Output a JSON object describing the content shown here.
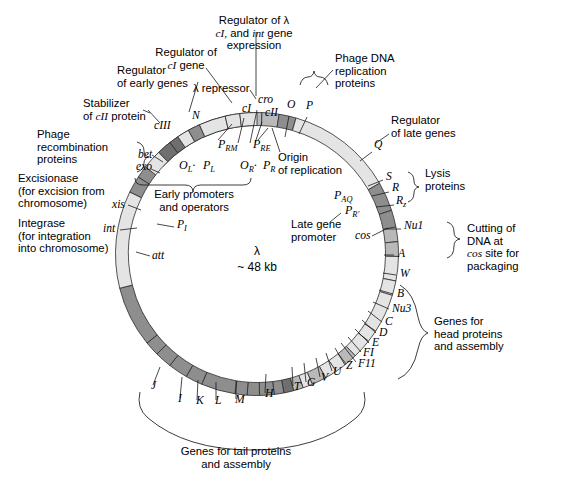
{
  "figure": {
    "center_label_line1": "λ",
    "center_label_line2": "~ 48 kb"
  },
  "colors": {
    "light": "#e4e4e4",
    "medium": "#b9b9b9",
    "dark": "#8e8e8e",
    "darkest": "#6f6f6f",
    "outline": "#2b2b2b",
    "text": "#000000",
    "background": "#ffffff"
  },
  "chart_data": {
    "type": "diagram",
    "subtype": "circular-genome-map",
    "title": "λ ~ 48 kb",
    "radius_px": 135,
    "band_width_px": 13,
    "center": [
      257,
      254
    ],
    "note": "Angles are degrees clockwise from 12 o'clock (top).",
    "segments": [
      {
        "name": "N",
        "start": -47,
        "end": -33,
        "shade": "light"
      },
      {
        "name": "spacer1",
        "start": -33,
        "end": -26,
        "shade": "light"
      },
      {
        "name": "cI",
        "start": -25,
        "end": -12,
        "shade": "darkest"
      },
      {
        "name": "gap_cI_cII",
        "start": -12,
        "end": -9,
        "shade": "light"
      },
      {
        "name": "cII",
        "start": -9,
        "end": -4,
        "shade": "darkest"
      },
      {
        "name": "ori",
        "start": -4,
        "end": 2,
        "shade": "medium"
      },
      {
        "name": "O",
        "start": 2,
        "end": 9,
        "shade": "medium"
      },
      {
        "name": "P",
        "start": 9,
        "end": 16,
        "shade": "dark"
      },
      {
        "name": "post_P",
        "start": 16,
        "end": 60,
        "shade": "light"
      },
      {
        "name": "Q",
        "start": 60,
        "end": 72,
        "shade": "dark"
      },
      {
        "name": "S",
        "start": 72,
        "end": 79,
        "shade": "dark"
      },
      {
        "name": "R",
        "start": 79,
        "end": 85,
        "shade": "medium"
      },
      {
        "name": "Rz",
        "start": 85,
        "end": 91,
        "shade": "medium"
      },
      {
        "name": "cos_region",
        "start": 91,
        "end": 101,
        "shade": "light"
      },
      {
        "name": "Nu1",
        "start": 101,
        "end": 107,
        "shade": "light"
      },
      {
        "name": "A",
        "start": 107,
        "end": 123,
        "shade": "light"
      },
      {
        "name": "W",
        "start": 123,
        "end": 128,
        "shade": "light"
      },
      {
        "name": "B",
        "start": 128,
        "end": 136,
        "shade": "light"
      },
      {
        "name": "Nu3",
        "start": 136,
        "end": 141,
        "shade": "medium"
      },
      {
        "name": "C",
        "start": 141,
        "end": 146,
        "shade": "light"
      },
      {
        "name": "D",
        "start": 146,
        "end": 151,
        "shade": "light"
      },
      {
        "name": "E",
        "start": 151,
        "end": 157,
        "shade": "medium"
      },
      {
        "name": "FI",
        "start": 157,
        "end": 161,
        "shade": "light"
      },
      {
        "name": "FII",
        "start": 161,
        "end": 165,
        "shade": "medium"
      },
      {
        "name": "Z",
        "start": 165,
        "end": 169,
        "shade": "darkest"
      },
      {
        "name": "U",
        "start": 169,
        "end": 173,
        "shade": "dark"
      },
      {
        "name": "V",
        "start": 173,
        "end": 179,
        "shade": "dark"
      },
      {
        "name": "G",
        "start": 179,
        "end": 184,
        "shade": "dark"
      },
      {
        "name": "T",
        "start": 184,
        "end": 189,
        "shade": "dark"
      },
      {
        "name": "H",
        "start": 189,
        "end": 203,
        "shade": "dark"
      },
      {
        "name": "M",
        "start": 203,
        "end": 210,
        "shade": "dark"
      },
      {
        "name": "L",
        "start": 210,
        "end": 218,
        "shade": "dark"
      },
      {
        "name": "K",
        "start": 218,
        "end": 225,
        "shade": "dark"
      },
      {
        "name": "I",
        "start": 225,
        "end": 231,
        "shade": "dark"
      },
      {
        "name": "J",
        "start": 231,
        "end": 256,
        "shade": "dark"
      },
      {
        "name": "att_region",
        "start": 256,
        "end": 296,
        "shade": "light"
      },
      {
        "name": "int",
        "start": 296,
        "end": 303,
        "shade": "dark"
      },
      {
        "name": "xis",
        "start": 303,
        "end": 308,
        "shade": "dark"
      },
      {
        "name": "spacer_xis_exo",
        "start": 308,
        "end": 316,
        "shade": "light"
      },
      {
        "name": "exo",
        "start": 316,
        "end": 322,
        "shade": "darkest"
      },
      {
        "name": "bet",
        "start": 322,
        "end": 326,
        "shade": "darkest"
      },
      {
        "name": "spacer_bet_cIII",
        "start": 326,
        "end": 331,
        "shade": "light"
      },
      {
        "name": "cIII",
        "start": 331,
        "end": 336,
        "shade": "dark"
      },
      {
        "name": "spacer_cIII_N",
        "start": 336,
        "end": 347,
        "shade": "light"
      },
      {
        "name": "pre_N",
        "start": 347,
        "end": 353,
        "shade": "light"
      },
      {
        "name": "tail_light",
        "start": 353,
        "end": 360,
        "shade": "light"
      }
    ]
  },
  "gene_labels": [
    {
      "id": "cI",
      "text": "cI",
      "x": 242,
      "y": 112
    },
    {
      "id": "cII",
      "text": "cII",
      "x": 265,
      "y": 116
    },
    {
      "id": "cro",
      "text": "cro",
      "x": 258,
      "y": 103
    },
    {
      "id": "O",
      "text": "O",
      "x": 287,
      "y": 108
    },
    {
      "id": "P",
      "text": "P",
      "x": 306,
      "y": 109
    },
    {
      "id": "N",
      "text": "N",
      "x": 192,
      "y": 119
    },
    {
      "id": "cIII",
      "text": "cIII",
      "x": 154,
      "y": 129
    },
    {
      "id": "bet",
      "text": "bet",
      "x": 138,
      "y": 158
    },
    {
      "id": "exo",
      "text": "exo",
      "x": 136,
      "y": 170
    },
    {
      "id": "xis",
      "text": "xis",
      "x": 112,
      "y": 208
    },
    {
      "id": "int",
      "text": "int",
      "x": 103,
      "y": 232
    },
    {
      "id": "PI",
      "text": "P",
      "sub": "I",
      "x": 177,
      "y": 228
    },
    {
      "id": "att",
      "text": "att",
      "x": 152,
      "y": 259
    },
    {
      "id": "Q",
      "text": "Q",
      "x": 374,
      "y": 148
    },
    {
      "id": "S",
      "text": "S",
      "x": 386,
      "y": 180
    },
    {
      "id": "R",
      "text": "R",
      "x": 392,
      "y": 191
    },
    {
      "id": "Rz",
      "text": "R",
      "sub": "z",
      "x": 396,
      "y": 204
    },
    {
      "id": "cos",
      "text": "cos",
      "x": 355,
      "y": 239
    },
    {
      "id": "Nu1",
      "text": "Nu1",
      "x": 404,
      "y": 229
    },
    {
      "id": "A",
      "text": "A",
      "x": 398,
      "y": 257
    },
    {
      "id": "W",
      "text": "W",
      "x": 400,
      "y": 277
    },
    {
      "id": "B",
      "text": "B",
      "x": 397,
      "y": 297
    },
    {
      "id": "Nu3",
      "text": "Nu3",
      "x": 392,
      "y": 312
    },
    {
      "id": "C",
      "text": "C",
      "x": 385,
      "y": 325
    },
    {
      "id": "D",
      "text": "D",
      "x": 379,
      "y": 336
    },
    {
      "id": "E",
      "text": "E",
      "x": 372,
      "y": 346
    },
    {
      "id": "FI",
      "text": "FI",
      "x": 363,
      "y": 356
    },
    {
      "id": "FII",
      "text": "F11",
      "x": 358,
      "y": 367
    },
    {
      "id": "Z",
      "text": "Z",
      "x": 346,
      "y": 369
    },
    {
      "id": "U",
      "text": "U",
      "x": 333,
      "y": 375
    },
    {
      "id": "V",
      "text": "V",
      "x": 321,
      "y": 381
    },
    {
      "id": "G",
      "text": "G",
      "x": 307,
      "y": 386
    },
    {
      "id": "T",
      "text": "T",
      "x": 294,
      "y": 390
    },
    {
      "id": "H",
      "text": "H",
      "x": 265,
      "y": 397
    },
    {
      "id": "M",
      "text": "M",
      "x": 235,
      "y": 403
    },
    {
      "id": "L",
      "text": "L",
      "x": 215,
      "y": 404
    },
    {
      "id": "K",
      "text": "K",
      "x": 196,
      "y": 404
    },
    {
      "id": "I",
      "text": "I",
      "x": 178,
      "y": 402
    },
    {
      "id": "J",
      "text": "J",
      "x": 151,
      "y": 389
    }
  ],
  "promoters": [
    {
      "id": "PRM",
      "base": "P",
      "sub": "RM",
      "x": 218,
      "y": 148
    },
    {
      "id": "PRE",
      "base": "P",
      "sub": "RE",
      "x": 253,
      "y": 148
    },
    {
      "id": "OL",
      "base": "O",
      "sub": "L",
      "x": 179,
      "y": 169,
      "sep": "·"
    },
    {
      "id": "PL",
      "base": "P",
      "sub": "L",
      "x": 203,
      "y": 169
    },
    {
      "id": "OR",
      "base": "O",
      "sub": "R",
      "x": 240,
      "y": 169,
      "sep": "·"
    },
    {
      "id": "PR",
      "base": "P",
      "sub": "R",
      "x": 263,
      "y": 169
    },
    {
      "id": "PAQ",
      "base": "P",
      "sub": "AQ",
      "x": 334,
      "y": 199
    },
    {
      "id": "PRp",
      "base": "P",
      "sub": "R′",
      "x": 345,
      "y": 214
    }
  ],
  "callouts": [
    {
      "id": "regulator-lambda-cI-int",
      "lines": [
        "Regulator of λ",
        "cI, and int gene",
        "expression"
      ],
      "x": 254,
      "y": 24,
      "anchor": "middle",
      "italic_words": [
        "cI",
        "int"
      ]
    },
    {
      "id": "regulator-cI-gene",
      "lines": [
        "Regulator of",
        "cI gene"
      ],
      "x": 186,
      "y": 56,
      "anchor": "middle",
      "italic_words": [
        "cI"
      ]
    },
    {
      "id": "lambda-repressor",
      "lines": [
        "λ repressor"
      ],
      "x": 193,
      "y": 92,
      "anchor": "start"
    },
    {
      "id": "phage-dna-replication-proteins",
      "lines": [
        "Phage DNA",
        "replication",
        "proteins"
      ],
      "x": 335,
      "y": 62,
      "anchor": "start"
    },
    {
      "id": "regulator-of-early-genes",
      "lines": [
        "Regulator",
        "of early genes"
      ],
      "x": 117,
      "y": 74,
      "anchor": "start"
    },
    {
      "id": "stabilizer-of-cII-protein",
      "lines": [
        "Stabilizer",
        "of cII protein"
      ],
      "x": 83,
      "y": 107,
      "anchor": "start",
      "italic_words": [
        "cII"
      ]
    },
    {
      "id": "phage-recombination-proteins",
      "lines": [
        "Phage",
        "recombination",
        "proteins"
      ],
      "x": 37,
      "y": 138,
      "anchor": "start"
    },
    {
      "id": "excisionase",
      "lines": [
        "Excisionase",
        "(for excision from",
        "chromosome)"
      ],
      "x": 18,
      "y": 182,
      "anchor": "start"
    },
    {
      "id": "integrase",
      "lines": [
        "Integrase",
        "(for integration",
        "into chromosome)"
      ],
      "x": 18,
      "y": 227,
      "anchor": "start"
    },
    {
      "id": "early-promoters-and-operators",
      "lines": [
        "Early promoters",
        "and operators"
      ],
      "x": 194,
      "y": 198,
      "anchor": "middle"
    },
    {
      "id": "origin-of-replication",
      "lines": [
        "Origin",
        "of replication"
      ],
      "x": 278,
      "y": 161,
      "anchor": "start"
    },
    {
      "id": "regulator-of-late-genes",
      "lines": [
        "Regulator",
        "of late genes"
      ],
      "x": 391,
      "y": 124,
      "anchor": "start"
    },
    {
      "id": "lysis-proteins",
      "lines": [
        "Lysis",
        "proteins"
      ],
      "x": 425,
      "y": 177,
      "anchor": "start"
    },
    {
      "id": "late-gene-promoter",
      "lines": [
        "Late gene",
        "promoter"
      ],
      "x": 291,
      "y": 228,
      "anchor": "start"
    },
    {
      "id": "cutting-of-dna-at-cos-site",
      "lines": [
        "Cutting of",
        "DNA at",
        "cos site for",
        "packaging"
      ],
      "x": 467,
      "y": 232,
      "anchor": "start",
      "italic_words": [
        "cos"
      ]
    },
    {
      "id": "genes-for-head-proteins",
      "lines": [
        "Genes for",
        "head proteins",
        "and assembly"
      ],
      "x": 434,
      "y": 325,
      "anchor": "start"
    },
    {
      "id": "genes-for-tail-proteins",
      "lines": [
        "Genes for tail proteins",
        "and assembly"
      ],
      "x": 236,
      "y": 455,
      "anchor": "middle"
    }
  ],
  "leader_lines": [
    {
      "id": "lead-cro",
      "d": "M 256 32 L 256 96"
    },
    {
      "id": "lead-cI-regulator",
      "d": "M 206 68 L 232 103"
    },
    {
      "id": "lead-repressor",
      "d": "M 250 90 L 256 99"
    },
    {
      "id": "lead-phage-dna-repl",
      "d": "M 333 70 L 316 88"
    },
    {
      "id": "lead-early-genes",
      "d": "M 198 82 L 189 112"
    },
    {
      "id": "lead-cIII",
      "d": "M 148 110 L 160 123"
    },
    {
      "id": "lead-cI-tick",
      "d": "M 244 118 L 238 143"
    },
    {
      "id": "lead-cII-tick",
      "d": "M 262 122 L 255 143"
    },
    {
      "id": "lead-cro-tick",
      "d": "M 257 110 L 250 143"
    },
    {
      "id": "lead-O-tick",
      "d": "M 289 116 L 285 137"
    },
    {
      "id": "lead-P-tick",
      "d": "M 307 117 L 299 134"
    },
    {
      "id": "lead-PRM",
      "d": "M 218 140 L 232 124"
    },
    {
      "id": "lead-PRE",
      "d": "M 258 140 L 268 128"
    },
    {
      "id": "lead-origin",
      "d": "M 280 152 L 272 128"
    },
    {
      "id": "lead-bet",
      "d": "M 152 155 L 163 162"
    },
    {
      "id": "lead-exo",
      "d": "M 151 169 L 160 173"
    },
    {
      "id": "lead-xis",
      "d": "M 128 205 L 141 210"
    },
    {
      "id": "lead-int",
      "d": "M 120 230 L 137 228"
    },
    {
      "id": "lead-PI",
      "d": "M 174 227 L 157 224"
    },
    {
      "id": "lead-att",
      "d": "M 150 256 L 136 252"
    },
    {
      "id": "lead-Q",
      "d": "M 389 134 L 376 143"
    },
    {
      "id": "lead-Qtick",
      "d": "M 372 152 L 360 161"
    },
    {
      "id": "lead-S",
      "d": "M 383 180 L 368 186"
    },
    {
      "id": "lead-R",
      "d": "M 389 192 L 372 196"
    },
    {
      "id": "lead-Rz",
      "d": "M 394 205 L 376 207"
    },
    {
      "id": "lead-cos",
      "d": "M 372 236 L 388 228"
    },
    {
      "id": "lead-Nu1",
      "d": "M 401 229 L 386 229"
    },
    {
      "id": "lead-A",
      "d": "M 394 255 L 384 255"
    },
    {
      "id": "lead-W",
      "d": "M 396 275 L 383 273"
    },
    {
      "id": "lead-B",
      "d": "M 393 294 L 379 290"
    },
    {
      "id": "lead-Nu3",
      "d": "M 389 309 L 373 302"
    },
    {
      "id": "lead-C",
      "d": "M 382 322 L 368 311"
    },
    {
      "id": "lead-D",
      "d": "M 376 333 L 362 320"
    },
    {
      "id": "lead-E",
      "d": "M 369 343 L 355 329"
    },
    {
      "id": "lead-FI",
      "d": "M 361 352 L 348 337"
    },
    {
      "id": "lead-FII",
      "d": "M 356 362 L 341 343"
    },
    {
      "id": "lead-Z",
      "d": "M 345 365 L 335 348"
    },
    {
      "id": "lead-U",
      "d": "M 332 371 L 326 353"
    },
    {
      "id": "lead-V",
      "d": "M 320 377 L 316 358"
    },
    {
      "id": "lead-G",
      "d": "M 306 382 L 304 363"
    },
    {
      "id": "lead-T",
      "d": "M 293 386 L 292 367"
    },
    {
      "id": "lead-H",
      "d": "M 265 393 L 266 374"
    },
    {
      "id": "lead-M",
      "d": "M 236 399 L 236 381"
    },
    {
      "id": "lead-L",
      "d": "M 216 400 L 216 382"
    },
    {
      "id": "lead-K",
      "d": "M 197 400 L 198 380"
    },
    {
      "id": "lead-I",
      "d": "M 180 398 L 182 377"
    },
    {
      "id": "lead-J",
      "d": "M 153 385 L 160 367"
    },
    {
      "id": "lead-stabilizer",
      "d": "M 150 113 L 143 110"
    },
    {
      "id": "lead-late-gene-prom",
      "d": "M 330 222 L 341 213"
    }
  ],
  "braces": [
    {
      "id": "brace-phage-dna-replication",
      "d": "M 300 85 q 2 -8 8 -8 q 5 0 6 -6 q 1 6 6 6 q 6 0 8 8"
    },
    {
      "id": "brace-recombination",
      "d": "M 137 142 q 7 2 7 9 q 0 5 5 6 q -5 1 -5 6 q 0 7 -7 9"
    },
    {
      "id": "brace-early-promoters",
      "d": "M 135 178 q 0 7 8 7 l 42 0 q 8 0 8 7 q 0 -7 8 -7 l 42 0 q 8 0 8 -7"
    },
    {
      "id": "brace-lysis",
      "d": "M 408 172 q 6 2 6 9 q 0 5 5 6 q -5 1 -5 6 q 0 7 -6 9"
    },
    {
      "id": "brace-cos-cutting",
      "d": "M 447 222 q 7 2 7 10 q 0 6 6 7 q -6 1 -6 7 q 0 10 -7 12"
    },
    {
      "id": "brace-head-genes",
      "d": "M 400 285 q 14 8 18 32 q 3 14 10 16 q -7 2 -10 16 q -5 24 -20 30"
    },
    {
      "id": "brace-tail-genes",
      "d": "M 140 392 q -4 16 8 26 q 38 32 104 32 q 66 0 104 -32 q 12 -10 8 -26"
    }
  ]
}
